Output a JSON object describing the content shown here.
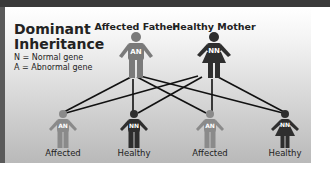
{
  "title": "Dominant Inheritance",
  "title_line1": "Dominant",
  "title_line2": "Inheritance",
  "legend": {
    "normal": "N = Normal gene",
    "abnormal": "A = Abnormal gene"
  },
  "parents": [
    {
      "label": "Affected Father",
      "genotype": "AN",
      "sex": "male",
      "color": "#7a7a7a"
    },
    {
      "label": "Healthy Mother",
      "genotype": "NN",
      "sex": "female",
      "color": "#2e2e2e"
    }
  ],
  "children": [
    {
      "label": "Affected",
      "genotype": "AN",
      "sex": "male",
      "color": "#8a8a8a"
    },
    {
      "label": "Healthy",
      "genotype": "NN",
      "sex": "male",
      "color": "#2e2e2e"
    },
    {
      "label": "Affected",
      "genotype": "AN",
      "sex": "male",
      "color": "#8a8a8a"
    },
    {
      "label": "Healthy",
      "genotype": "NN",
      "sex": "female",
      "color": "#2e2e2e"
    }
  ]
}
